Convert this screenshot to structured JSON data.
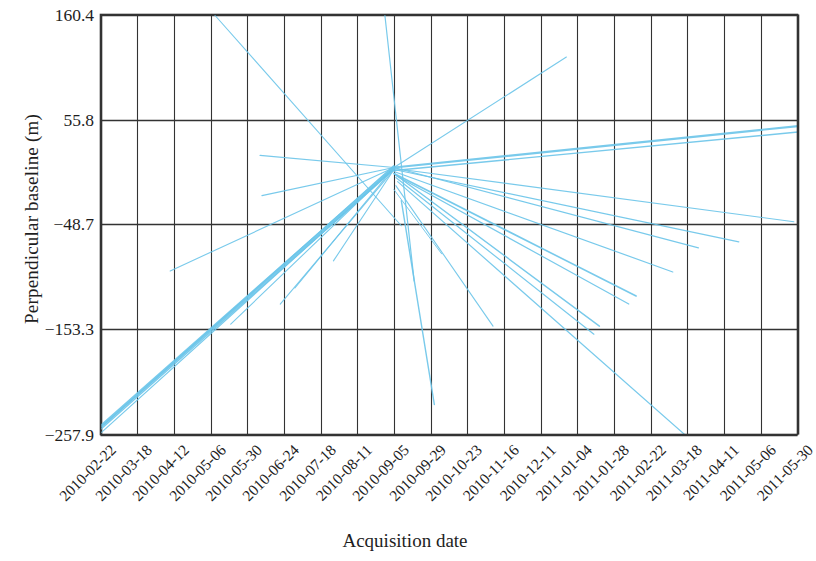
{
  "chart_data": {
    "type": "line",
    "title": "",
    "xlabel": "Acquisition date",
    "ylabel": "Perpendicular baseline (m)",
    "grid": true,
    "legend": null,
    "line_color": "#6EC6EA",
    "axis_color": "#333333",
    "background": "#ffffff",
    "ylim": [
      -257.9,
      160.4
    ],
    "yticks": [
      "160.4",
      "55.8",
      "-48.7",
      "-153.3",
      "-257.9"
    ],
    "ytick_values": [
      160.4,
      55.8,
      -48.7,
      -153.3,
      -257.9
    ],
    "xticks": [
      "2010-02-22",
      "2010-03-18",
      "2010-04-12",
      "2010-05-06",
      "2010-05-30",
      "2010-06-24",
      "2010-07-18",
      "2010-08-11",
      "2010-09-05",
      "2010-09-29",
      "2010-10-23",
      "2010-11-16",
      "2010-12-11",
      "2011-01-04",
      "2011-01-28",
      "2011-02-22",
      "2011-03-18",
      "2011-04-11",
      "2011-05-06",
      "2011-05-30"
    ],
    "nodes": [
      {
        "date": "2010-02-22",
        "x": 0.0,
        "baseline": -250.0
      },
      {
        "date": "2010-03-18",
        "x": 1.0,
        "baseline": -215.0
      },
      {
        "date": "2010-04-12",
        "x": 2.0,
        "baseline": -190.0
      },
      {
        "date": "2010-05-06",
        "x": 3.0,
        "baseline": -150.0
      },
      {
        "date": "2010-05-30",
        "x": 4.0,
        "baseline": 150.0
      },
      {
        "date": "2010-06-24",
        "x": 5.0,
        "baseline": -100.0
      },
      {
        "date": "2010-07-18",
        "x": 6.0,
        "baseline": 20.0
      },
      {
        "date": "2010-08-11",
        "x": 7.0,
        "baseline": -55.0
      },
      {
        "date": "2010-09-05",
        "x": 8.0,
        "baseline": 8.0
      },
      {
        "date": "2010-09-29",
        "x": 9.0,
        "baseline": 160.0
      },
      {
        "date": "2010-10-23",
        "x": 10.0,
        "baseline": -60.0
      },
      {
        "date": "2010-11-16",
        "x": 11.0,
        "baseline": -95.0
      },
      {
        "date": "2010-12-11",
        "x": 12.0,
        "baseline": -120.0
      },
      {
        "date": "2011-01-04",
        "x": 13.0,
        "baseline": 95.0
      },
      {
        "date": "2011-01-28",
        "x": 14.0,
        "baseline": -140.0
      },
      {
        "date": "2011-02-22",
        "x": 15.0,
        "baseline": -175.0
      },
      {
        "date": "2011-03-18",
        "x": 16.0,
        "baseline": -80.0
      },
      {
        "date": "2011-04-11",
        "x": 17.0,
        "baseline": -70.0
      },
      {
        "date": "2011-05-06",
        "x": 18.0,
        "baseline": 40.0
      },
      {
        "date": "2011-05-30",
        "x": 19.0,
        "baseline": 48.0
      }
    ],
    "edges": [
      {
        "x1": 0.0,
        "y1": -250.0,
        "x2": 8.0,
        "y2": 8.0,
        "w": 3.0
      },
      {
        "x1": 0.0,
        "y1": -253.0,
        "x2": 8.0,
        "y2": 6.0,
        "w": 1.4
      },
      {
        "x1": 0.02,
        "y1": -256.0,
        "x2": 7.9,
        "y2": 4.0,
        "w": 1.2
      },
      {
        "x1": 0.1,
        "y1": -248.0,
        "x2": 8.0,
        "y2": 10.0,
        "w": 1.2
      },
      {
        "x1": 3.55,
        "y1": -148.0,
        "x2": 8.0,
        "y2": 8.0,
        "w": 1.1
      },
      {
        "x1": 5.3,
        "y1": -112.0,
        "x2": 8.0,
        "y2": 8.0,
        "w": 1.1
      },
      {
        "x1": 3.1,
        "y1": 160.4,
        "x2": 8.2,
        "y2": -50.0,
        "w": 1.1
      },
      {
        "x1": 7.75,
        "y1": 160.4,
        "x2": 8.55,
        "y2": -105.0,
        "w": 1.2
      },
      {
        "x1": 8.0,
        "y1": 8.0,
        "x2": 12.7,
        "y2": 118.0,
        "w": 1.1
      },
      {
        "x1": 4.35,
        "y1": 20.0,
        "x2": 8.0,
        "y2": 8.0,
        "w": 1.2
      },
      {
        "x1": 4.4,
        "y1": -20.0,
        "x2": 8.0,
        "y2": 8.0,
        "w": 1.1
      },
      {
        "x1": 8.0,
        "y1": 8.0,
        "x2": 19.2,
        "y2": 50.0,
        "w": 2.2
      },
      {
        "x1": 8.0,
        "y1": 5.0,
        "x2": 19.2,
        "y2": 44.0,
        "w": 1.4
      },
      {
        "x1": 8.0,
        "y1": 8.0,
        "x2": 16.3,
        "y2": -72.0,
        "w": 1.2
      },
      {
        "x1": 8.0,
        "y1": 6.0,
        "x2": 17.4,
        "y2": -66.0,
        "w": 1.2
      },
      {
        "x1": 8.0,
        "y1": 4.0,
        "x2": 15.6,
        "y2": -96.0,
        "w": 1.2
      },
      {
        "x1": 8.0,
        "y1": 2.0,
        "x2": 14.6,
        "y2": -120.0,
        "w": 1.6
      },
      {
        "x1": 8.05,
        "y1": 0.0,
        "x2": 14.4,
        "y2": -128.0,
        "w": 1.2
      },
      {
        "x1": 8.0,
        "y1": 2.0,
        "x2": 13.6,
        "y2": -150.0,
        "w": 1.4
      },
      {
        "x1": 8.05,
        "y1": -2.0,
        "x2": 13.45,
        "y2": -158.0,
        "w": 1.2
      },
      {
        "x1": 8.1,
        "y1": -6.0,
        "x2": 16.05,
        "y2": -262.0,
        "w": 1.2
      },
      {
        "x1": 8.2,
        "y1": -25.0,
        "x2": 9.1,
        "y2": -228.0,
        "w": 1.4
      },
      {
        "x1": 8.05,
        "y1": -10.0,
        "x2": 10.7,
        "y2": -150.0,
        "w": 1.1
      },
      {
        "x1": 8.0,
        "y1": -14.0,
        "x2": 9.3,
        "y2": -78.0,
        "w": 1.0
      },
      {
        "x1": 6.35,
        "y1": -85.0,
        "x2": 8.0,
        "y2": 6.0,
        "w": 1.1
      },
      {
        "x1": 4.9,
        "y1": -128.0,
        "x2": 8.0,
        "y2": 6.0,
        "w": 1.1
      },
      {
        "x1": 1.9,
        "y1": -95.0,
        "x2": 8.0,
        "y2": 8.0,
        "w": 1.1
      },
      {
        "x1": 8.0,
        "y1": 7.0,
        "x2": 18.9,
        "y2": -46.0,
        "w": 1.2
      }
    ]
  }
}
